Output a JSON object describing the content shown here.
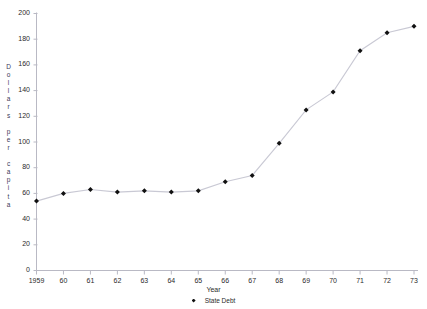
{
  "chart_data": {
    "type": "line",
    "title": "",
    "xlabel": "Year",
    "ylabel": "Dollars per capita",
    "ylabel_letters": [
      "D",
      "o",
      "l",
      "l",
      "a",
      "r",
      "s",
      "",
      "p",
      "e",
      "r",
      "",
      "c",
      "a",
      "p",
      "i",
      "t",
      "a"
    ],
    "legend": [
      "State Debt"
    ],
    "legend_position": "bottom-center",
    "grid": false,
    "marker": "diamond",
    "series_color": "#111111",
    "line_color": "#c9c9d4",
    "axis_color": "#b9b9c4",
    "x": [
      1959,
      1960,
      1961,
      1962,
      1963,
      1964,
      1965,
      1966,
      1967,
      1968,
      1969,
      1970,
      1971,
      1972,
      1973
    ],
    "xtick_labels": [
      "1959",
      "60",
      "61",
      "62",
      "63",
      "64",
      "65",
      "66",
      "67",
      "68",
      "69",
      "70",
      "71",
      "72",
      "73"
    ],
    "xlim": [
      1959,
      1973
    ],
    "ylim": [
      0,
      200
    ],
    "ytick_values": [
      0,
      20,
      40,
      60,
      80,
      100,
      120,
      140,
      160,
      180,
      200
    ],
    "ytick_labels": [
      "0",
      "20",
      "40",
      "60",
      "80",
      "100",
      "120",
      "140",
      "160",
      "180",
      "200"
    ],
    "series": [
      {
        "name": "State Debt",
        "values": [
          54,
          60,
          63,
          61,
          62,
          61,
          62,
          69,
          74,
          99,
          125,
          139,
          171,
          185,
          190
        ]
      }
    ]
  }
}
